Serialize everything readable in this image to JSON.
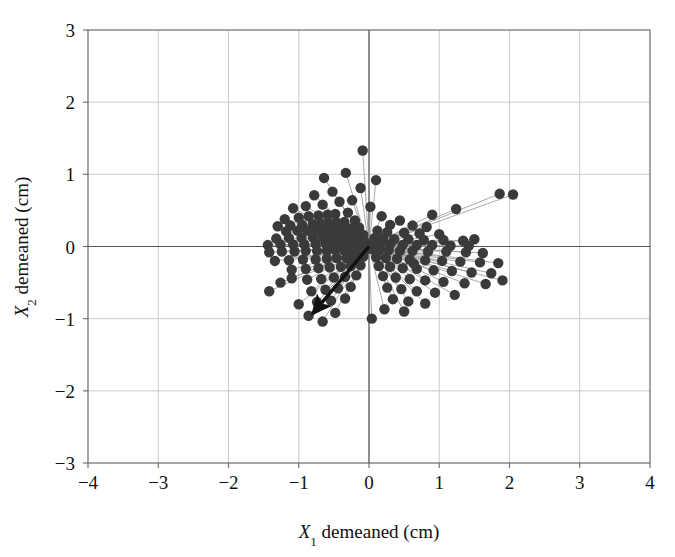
{
  "chart_data": {
    "type": "scatter",
    "title": "",
    "xlabel": "X1 demeaned (cm)",
    "ylabel": "X2 demeaned (cm)",
    "xlabel_parts": {
      "var": "X",
      "sub": "1",
      "rest": " demeaned (cm)"
    },
    "ylabel_parts": {
      "var": "X",
      "sub": "2",
      "rest": " demeaned (cm)"
    },
    "xlim": [
      -4,
      4
    ],
    "ylim": [
      -3,
      3
    ],
    "xticks": [
      -4,
      -3,
      -2,
      -1,
      0,
      1,
      2,
      3,
      4
    ],
    "yticks": [
      -3,
      -2,
      -1,
      0,
      1,
      2,
      3
    ],
    "xtick_labels": [
      "−4",
      "−3",
      "−2",
      "−1",
      "0",
      "1",
      "2",
      "3",
      "4"
    ],
    "ytick_labels": [
      "−3",
      "−2",
      "−1",
      "0",
      "1",
      "2",
      "3"
    ],
    "grid": true,
    "grid_color": "#c9c9c9",
    "axis_color": "#555555",
    "frame_color": "#6b6b6b",
    "point_color": "#3a3a3a",
    "point_radius": 5.2,
    "spoke_color": "#9a9a9a",
    "spokes_from_origin": true,
    "legend": "none",
    "background": "#ffffff",
    "annotations": [
      {
        "name": "bold-arrow",
        "type": "arrow",
        "from": [
          0,
          0
        ],
        "to": [
          -0.8,
          -0.93
        ],
        "color": "#111111",
        "width": 3.4
      }
    ],
    "points": [
      [
        -0.09,
        1.33
      ],
      [
        -0.33,
        1.02
      ],
      [
        -0.64,
        0.95
      ],
      [
        0.1,
        0.92
      ],
      [
        -0.12,
        0.81
      ],
      [
        -0.52,
        0.76
      ],
      [
        -0.78,
        0.71
      ],
      [
        2.05,
        0.72
      ],
      [
        1.86,
        0.73
      ],
      [
        -0.24,
        0.64
      ],
      [
        -0.42,
        0.62
      ],
      [
        -0.66,
        0.58
      ],
      [
        -0.9,
        0.56
      ],
      [
        -1.08,
        0.53
      ],
      [
        0.02,
        0.55
      ],
      [
        1.24,
        0.52
      ],
      [
        -0.3,
        0.47
      ],
      [
        -0.48,
        0.45
      ],
      [
        -0.59,
        0.44
      ],
      [
        -0.72,
        0.43
      ],
      [
        -0.86,
        0.42
      ],
      [
        -1.0,
        0.4
      ],
      [
        -1.2,
        0.38
      ],
      [
        0.18,
        0.42
      ],
      [
        0.44,
        0.36
      ],
      [
        -0.2,
        0.36
      ],
      [
        -0.35,
        0.34
      ],
      [
        -0.46,
        0.33
      ],
      [
        -0.57,
        0.33
      ],
      [
        -0.68,
        0.32
      ],
      [
        -0.8,
        0.31
      ],
      [
        -0.95,
        0.3
      ],
      [
        -1.12,
        0.29
      ],
      [
        -1.3,
        0.28
      ],
      [
        0.3,
        0.3
      ],
      [
        0.62,
        0.29
      ],
      [
        0.82,
        0.27
      ],
      [
        -0.14,
        0.26
      ],
      [
        -0.26,
        0.25
      ],
      [
        -0.38,
        0.25
      ],
      [
        -0.5,
        0.24
      ],
      [
        -0.62,
        0.24
      ],
      [
        -0.74,
        0.23
      ],
      [
        -0.88,
        0.22
      ],
      [
        -1.02,
        0.22
      ],
      [
        -1.18,
        0.21
      ],
      [
        0.12,
        0.22
      ],
      [
        0.26,
        0.2
      ],
      [
        0.5,
        0.19
      ],
      [
        0.72,
        0.18
      ],
      [
        1.0,
        0.17
      ],
      [
        -0.08,
        0.16
      ],
      [
        -0.18,
        0.15
      ],
      [
        -0.3,
        0.15
      ],
      [
        -0.42,
        0.14
      ],
      [
        -0.54,
        0.14
      ],
      [
        -0.66,
        0.13
      ],
      [
        -0.8,
        0.13
      ],
      [
        -0.96,
        0.12
      ],
      [
        -1.14,
        0.12
      ],
      [
        -1.32,
        0.11
      ],
      [
        0.08,
        0.12
      ],
      [
        0.2,
        0.11
      ],
      [
        0.36,
        0.1
      ],
      [
        0.56,
        0.1
      ],
      [
        0.78,
        0.09
      ],
      [
        1.06,
        0.09
      ],
      [
        1.34,
        0.08
      ],
      [
        -0.05,
        0.06
      ],
      [
        -0.15,
        0.05
      ],
      [
        -0.26,
        0.05
      ],
      [
        -0.38,
        0.05
      ],
      [
        -0.5,
        0.04
      ],
      [
        -0.62,
        0.04
      ],
      [
        -0.76,
        0.04
      ],
      [
        -0.92,
        0.03
      ],
      [
        -1.08,
        0.03
      ],
      [
        -1.26,
        0.03
      ],
      [
        -1.44,
        0.02
      ],
      [
        0.06,
        0.04
      ],
      [
        0.16,
        0.03
      ],
      [
        0.3,
        0.03
      ],
      [
        0.48,
        0.02
      ],
      [
        0.68,
        0.02
      ],
      [
        0.9,
        0.02
      ],
      [
        1.16,
        0.01
      ],
      [
        1.42,
        0.01
      ],
      [
        -0.04,
        -0.04
      ],
      [
        -0.14,
        -0.04
      ],
      [
        -0.25,
        -0.05
      ],
      [
        -0.36,
        -0.05
      ],
      [
        -0.48,
        -0.05
      ],
      [
        -0.6,
        -0.06
      ],
      [
        -0.74,
        -0.06
      ],
      [
        -0.9,
        -0.06
      ],
      [
        -1.06,
        -0.07
      ],
      [
        -1.24,
        -0.07
      ],
      [
        -1.42,
        -0.08
      ],
      [
        0.05,
        -0.04
      ],
      [
        0.15,
        -0.05
      ],
      [
        0.28,
        -0.05
      ],
      [
        0.44,
        -0.06
      ],
      [
        0.62,
        -0.06
      ],
      [
        0.84,
        -0.07
      ],
      [
        1.1,
        -0.07
      ],
      [
        1.38,
        -0.08
      ],
      [
        1.62,
        -0.09
      ],
      [
        -0.08,
        -0.14
      ],
      [
        -0.2,
        -0.15
      ],
      [
        -0.32,
        -0.16
      ],
      [
        -0.46,
        -0.16
      ],
      [
        -0.6,
        -0.17
      ],
      [
        -0.76,
        -0.18
      ],
      [
        -0.94,
        -0.18
      ],
      [
        -1.14,
        -0.19
      ],
      [
        -1.34,
        -0.2
      ],
      [
        0.1,
        -0.15
      ],
      [
        0.24,
        -0.16
      ],
      [
        0.4,
        -0.17
      ],
      [
        0.58,
        -0.18
      ],
      [
        0.8,
        -0.19
      ],
      [
        1.04,
        -0.2
      ],
      [
        1.3,
        -0.21
      ],
      [
        1.58,
        -0.22
      ],
      [
        1.84,
        -0.23
      ],
      [
        -0.12,
        -0.26
      ],
      [
        -0.26,
        -0.27
      ],
      [
        -0.4,
        -0.28
      ],
      [
        -0.56,
        -0.29
      ],
      [
        -0.72,
        -0.3
      ],
      [
        -0.9,
        -0.31
      ],
      [
        -1.1,
        -0.32
      ],
      [
        0.14,
        -0.27
      ],
      [
        0.3,
        -0.28
      ],
      [
        0.48,
        -0.3
      ],
      [
        0.68,
        -0.31
      ],
      [
        0.92,
        -0.33
      ],
      [
        1.18,
        -0.34
      ],
      [
        1.46,
        -0.36
      ],
      [
        1.74,
        -0.37
      ],
      [
        -0.18,
        -0.4
      ],
      [
        -0.34,
        -0.42
      ],
      [
        -0.5,
        -0.43
      ],
      [
        -0.68,
        -0.45
      ],
      [
        -0.88,
        -0.46
      ],
      [
        0.2,
        -0.41
      ],
      [
        0.38,
        -0.43
      ],
      [
        0.58,
        -0.45
      ],
      [
        0.8,
        -0.47
      ],
      [
        1.06,
        -0.49
      ],
      [
        1.36,
        -0.51
      ],
      [
        1.66,
        -0.52
      ],
      [
        1.9,
        -0.47
      ],
      [
        -0.26,
        -0.56
      ],
      [
        -0.44,
        -0.58
      ],
      [
        -0.62,
        -0.6
      ],
      [
        -0.82,
        -0.62
      ],
      [
        0.26,
        -0.57
      ],
      [
        0.46,
        -0.59
      ],
      [
        0.68,
        -0.62
      ],
      [
        0.94,
        -0.64
      ],
      [
        1.22,
        -0.67
      ],
      [
        -0.34,
        -0.72
      ],
      [
        -0.54,
        -0.75
      ],
      [
        -0.74,
        -0.77
      ],
      [
        -1.0,
        -0.8
      ],
      [
        0.34,
        -0.73
      ],
      [
        0.56,
        -0.76
      ],
      [
        0.8,
        -0.79
      ],
      [
        0.22,
        -0.87
      ],
      [
        0.5,
        -0.9
      ],
      [
        -0.48,
        -0.92
      ],
      [
        -0.86,
        -0.96
      ],
      [
        0.04,
        -1.0
      ],
      [
        -0.66,
        -1.04
      ],
      [
        -1.42,
        -0.62
      ],
      [
        -1.26,
        -0.5
      ],
      [
        -1.1,
        -0.44
      ],
      [
        0.64,
        -0.24
      ],
      [
        1.5,
        0.1
      ],
      [
        0.9,
        0.44
      ]
    ]
  },
  "figure": {
    "width": 675,
    "height": 557,
    "plot_left": 88,
    "plot_right": 650,
    "plot_top": 30,
    "plot_bottom": 463
  }
}
